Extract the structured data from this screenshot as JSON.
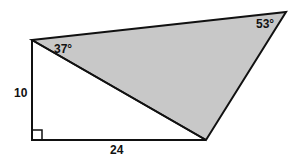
{
  "diagram": {
    "type": "geometry-figure",
    "colors": {
      "stroke": "#111111",
      "shaded_fill": "#c8c8c8",
      "background": "#ffffff"
    },
    "vertices": {
      "top_left": [
        32,
        40
      ],
      "top_right": [
        286,
        12
      ],
      "bottom_right": [
        206,
        140
      ],
      "bottom_left": [
        32,
        140
      ]
    },
    "labels": {
      "angle_top_left": "37°",
      "angle_top_right": "53°",
      "side_left": "10",
      "side_bottom": "24"
    },
    "right_angle_marker": "bottom-left"
  }
}
